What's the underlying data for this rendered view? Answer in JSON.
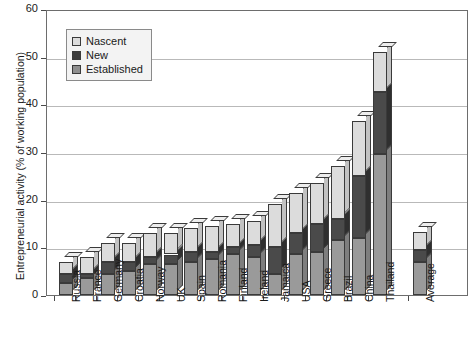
{
  "chart_data": {
    "type": "bar",
    "stacked": true,
    "title": "",
    "xlabel": "",
    "ylabel": "Entrepreneurial activity (% of working population)",
    "ylim": [
      0,
      60
    ],
    "yticks": [
      0,
      10,
      20,
      30,
      40,
      50,
      60
    ],
    "grid": true,
    "legend_position": "top-left",
    "categories": [
      "Russia",
      "France",
      "Germany",
      "Croatia",
      "Norway",
      "UK",
      "Spain",
      "Romania",
      "Finland",
      "Ireland",
      "Jamaica",
      "USA",
      "Greece",
      "Brazil",
      "China",
      "Thailand",
      "Average"
    ],
    "series": [
      {
        "name": "Established",
        "color": "#9a9a9a",
        "values": [
          2.5,
          3.5,
          4.5,
          5.0,
          6.5,
          6.5,
          7.0,
          7.5,
          8.5,
          8.0,
          4.5,
          8.5,
          9.0,
          11.5,
          12.0,
          29.5,
          7.0
        ]
      },
      {
        "name": "New",
        "color": "#4a4a4a",
        "values": [
          2.0,
          1.0,
          2.5,
          2.0,
          1.5,
          2.0,
          2.0,
          1.5,
          1.5,
          2.5,
          5.5,
          4.5,
          6.0,
          4.5,
          13.0,
          13.0,
          2.5
        ]
      },
      {
        "name": "Nascent",
        "color": "#dcdcdc",
        "values": [
          2.5,
          3.5,
          4.0,
          4.0,
          5.0,
          4.5,
          5.0,
          5.5,
          5.0,
          5.0,
          9.0,
          8.5,
          8.5,
          11.0,
          11.5,
          8.5,
          3.8
        ]
      }
    ],
    "totals": [
      7.0,
      8.0,
      11.0,
      11.0,
      13.0,
      13.0,
      14.0,
      14.5,
      15.0,
      15.5,
      19.0,
      21.5,
      23.5,
      27.0,
      36.5,
      51.0,
      13.3
    ]
  },
  "legend": {
    "items": [
      {
        "label": "Nascent",
        "key": "nascent"
      },
      {
        "label": "New",
        "key": "new"
      },
      {
        "label": "Established",
        "key": "established"
      }
    ]
  },
  "colors": {
    "nascent": "#dcdcdc",
    "new": "#4a4a4a",
    "established": "#9a9a9a",
    "axis": "#6d6d6d",
    "grid": "#b9b9b9"
  }
}
